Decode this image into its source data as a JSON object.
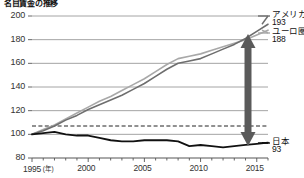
{
  "chart_data": {
    "type": "line",
    "title": "名目賃金の推移",
    "xlabel": "年",
    "ylabel": "",
    "xlim": [
      1995,
      2016
    ],
    "ylim": [
      80,
      200
    ],
    "yticks": [
      80,
      100,
      120,
      140,
      160,
      180,
      200
    ],
    "xticks": [
      1995,
      2000,
      2005,
      2010,
      2015
    ],
    "xtick_labels": [
      "1995",
      "2000",
      "2005",
      "2010",
      "2015"
    ],
    "xunit_label": "(年)",
    "grid": true,
    "baseline": 100,
    "legend_position": "right",
    "annotation": "vertical-double-arrow",
    "series": [
      {
        "name": "アメリカ",
        "end_label": "アメリカ",
        "end_value": "193",
        "color": "#6e6e6e",
        "x": [
          1995,
          1996,
          1997,
          1998,
          1999,
          2000,
          2001,
          2002,
          2003,
          2004,
          2005,
          2006,
          2007,
          2008,
          2009,
          2010,
          2011,
          2012,
          2013,
          2014,
          2015,
          2016
        ],
        "values": [
          100,
          103,
          107,
          112,
          116,
          121,
          125,
          129,
          133,
          138,
          143,
          149,
          155,
          160,
          162,
          164,
          168,
          172,
          176,
          181,
          187,
          193
        ]
      },
      {
        "name": "ユーロ圏",
        "end_label": "ユーロ圏",
        "end_value": "188",
        "color": "#a8a8a8",
        "x": [
          1995,
          1996,
          1997,
          1998,
          1999,
          2000,
          2001,
          2002,
          2003,
          2004,
          2005,
          2006,
          2007,
          2008,
          2009,
          2010,
          2011,
          2012,
          2013,
          2014,
          2015,
          2016
        ],
        "values": [
          100,
          104,
          108,
          113,
          118,
          123,
          128,
          132,
          137,
          142,
          147,
          153,
          159,
          164,
          166,
          168,
          171,
          174,
          177,
          180,
          184,
          188
        ]
      },
      {
        "name": "日本",
        "end_label": "日本",
        "end_value": "93",
        "color": "#111111",
        "x": [
          1995,
          1996,
          1997,
          1998,
          1999,
          2000,
          2001,
          2002,
          2003,
          2004,
          2005,
          2006,
          2007,
          2008,
          2009,
          2010,
          2011,
          2012,
          2013,
          2014,
          2015,
          2016
        ],
        "values": [
          100,
          101,
          102,
          100,
          99,
          99,
          97,
          95,
          94,
          94,
          95,
          95,
          95,
          94,
          90,
          91,
          90,
          89,
          90,
          91,
          92,
          93
        ]
      }
    ]
  }
}
